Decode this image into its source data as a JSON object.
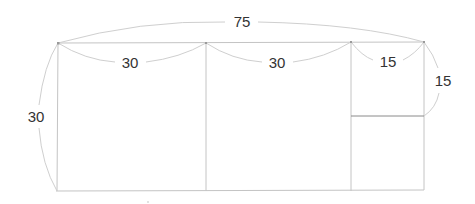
{
  "diagram": {
    "type": "rectangle-dimension-diagram",
    "colors": {
      "background": "#ffffff",
      "edge": "#c4c4c4",
      "edge_dark": "#8a8a8a",
      "arc": "#cfcfcf",
      "label": "#333333"
    },
    "dimensions": {
      "total_width": "75",
      "height": "30",
      "segment_1": "30",
      "segment_2": "30",
      "segment_3": "15",
      "small_square_side": "15"
    },
    "regions": [
      {
        "name": "square-a",
        "width": 30,
        "height": 30
      },
      {
        "name": "square-b",
        "width": 30,
        "height": 30
      },
      {
        "name": "small-square-top",
        "width": 15,
        "height": 15
      },
      {
        "name": "small-rect-bottom",
        "width": 15,
        "height": 15
      }
    ]
  }
}
